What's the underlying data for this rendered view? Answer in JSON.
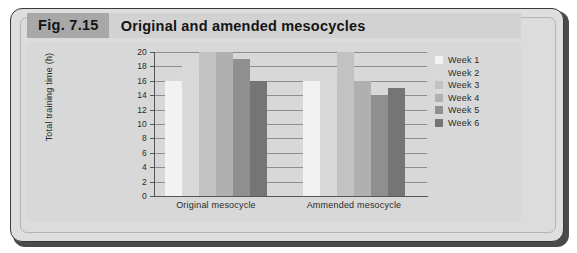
{
  "figure": {
    "number": "Fig. 7.15",
    "title": "Original and amended mesocycles"
  },
  "colors": {
    "panel_background": "#d8d8d8",
    "frame_background": "#dedede",
    "title_band": "#d2d2d2",
    "fig_number_band": "#a8a8a8",
    "grid": "#8e8e8e",
    "axis": "#555555",
    "series": [
      "#f2f2f2",
      "#d9d9d9",
      "#c2c2c2",
      "#b0b0b0",
      "#8f8f8f",
      "#757575"
    ]
  },
  "chart_data": {
    "type": "bar",
    "title": "Original and amended mesocycles",
    "xlabel": "",
    "ylabel": "Total training time (h)",
    "categories": [
      "Original mesocycle",
      "Ammended mesocycle"
    ],
    "ylim": [
      0,
      20
    ],
    "yticks": [
      "0",
      "2",
      "4",
      "6",
      "8",
      "10",
      "12",
      "14",
      "16",
      "18",
      "20"
    ],
    "grid": true,
    "legend_position": "right",
    "series": [
      {
        "name": "Week 1",
        "color": "#f2f2f2",
        "values": [
          16,
          16
        ]
      },
      {
        "name": "Week 2",
        "color": "#d9d9d9",
        "values": [
          18,
          16
        ]
      },
      {
        "name": "Week 3",
        "color": "#c2c2c2",
        "values": [
          20,
          20
        ]
      },
      {
        "name": "Week 4",
        "color": "#b0b0b0",
        "values": [
          20,
          16
        ]
      },
      {
        "name": "Week 5",
        "color": "#8f8f8f",
        "values": [
          19,
          14
        ]
      },
      {
        "name": "Week 6",
        "color": "#757575",
        "values": [
          16,
          15
        ]
      }
    ]
  }
}
